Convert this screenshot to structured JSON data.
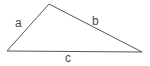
{
  "diagram": {
    "type": "triangle",
    "background_color": "#ffffff",
    "stroke_color": "#555555",
    "label_color": "#4a4a4a",
    "stroke_width": 1,
    "vertices": {
      "left": {
        "x": 7,
        "y": 51
      },
      "apex": {
        "x": 49,
        "y": 4
      },
      "right": {
        "x": 142,
        "y": 52
      }
    },
    "sides": [
      {
        "id": "a",
        "label": "a",
        "from": "left",
        "to": "apex",
        "label_x": 15,
        "label_y": 17
      },
      {
        "id": "b",
        "label": "b",
        "from": "apex",
        "to": "right",
        "label_x": 92,
        "label_y": 15
      },
      {
        "id": "c",
        "label": "c",
        "from": "left",
        "to": "right",
        "label_x": 65,
        "label_y": 52
      }
    ]
  }
}
